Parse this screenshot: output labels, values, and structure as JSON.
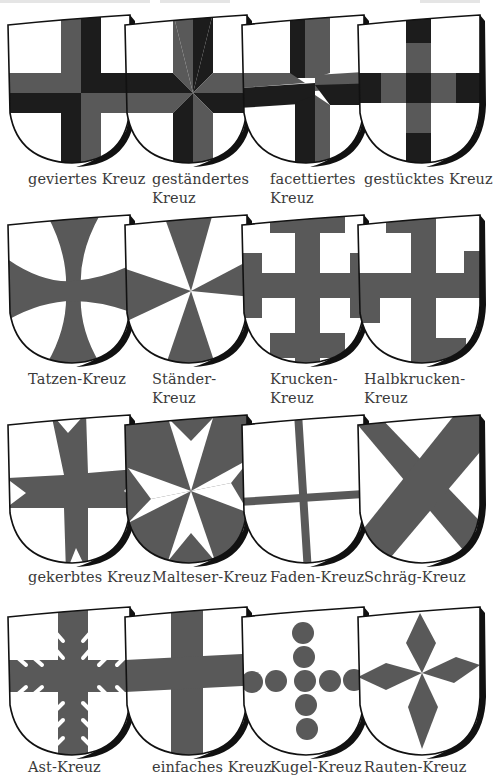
{
  "header": {
    "text_visible": false
  },
  "colors": {
    "field": "#ffffff",
    "grey": "#595959",
    "black": "#1c1c1c",
    "outline": "#111111",
    "label": "#3a3a3a"
  },
  "rows": [
    {
      "items": [
        {
          "label_lines": [
            "geviertes Kreuz"
          ],
          "pattern": "geviert"
        },
        {
          "label_lines": [
            "geständertes",
            "Kreuz"
          ],
          "pattern": "gestaendert"
        },
        {
          "label_lines": [
            "facettiertes",
            "Kreuz"
          ],
          "pattern": "facettiert"
        },
        {
          "label_lines": [
            "gestücktes Kreuz"
          ],
          "pattern": "gestueckt"
        }
      ]
    },
    {
      "items": [
        {
          "label_lines": [
            "Tatzen-Kreuz"
          ],
          "pattern": "tatzen"
        },
        {
          "label_lines": [
            "Ständer-",
            "Kreuz"
          ],
          "pattern": "staender"
        },
        {
          "label_lines": [
            "Krucken-",
            "Kreuz"
          ],
          "pattern": "krucken"
        },
        {
          "label_lines": [
            "Halbkrucken-",
            "Kreuz"
          ],
          "pattern": "halbkrucken"
        }
      ]
    },
    {
      "items": [
        {
          "label_lines": [
            "gekerbtes Kreuz"
          ],
          "pattern": "gekerbt"
        },
        {
          "label_lines": [
            "Malteser-Kreuz"
          ],
          "pattern": "malteser"
        },
        {
          "label_lines": [
            "Faden-Kreuz"
          ],
          "pattern": "faden"
        },
        {
          "label_lines": [
            "Schräg-Kreuz"
          ],
          "pattern": "schraeg"
        }
      ]
    },
    {
      "items": [
        {
          "label_lines": [
            "Ast-Kreuz"
          ],
          "pattern": "ast"
        },
        {
          "label_lines": [
            "einfaches Kreuz"
          ],
          "pattern": "einfach"
        },
        {
          "label_lines": [
            "Kugel-Kreuz"
          ],
          "pattern": "kugel"
        },
        {
          "label_lines": [
            "Rauten-Kreuz"
          ],
          "pattern": "rauten"
        }
      ]
    }
  ]
}
